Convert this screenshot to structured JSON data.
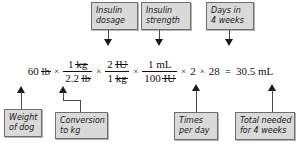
{
  "diagram": {
    "colors": {
      "box_fill": "#d9d9d9",
      "box_border": "#6e6e6e",
      "connector": "#4a4a4a",
      "text": "#111111",
      "background": "#ffffff"
    }
  },
  "equation": {
    "start_value": "60",
    "start_unit": "lb",
    "times_1": "×",
    "frac1": {
      "numerator_value": "1",
      "numerator_unit": "kg",
      "denominator_value": "2.2",
      "denominator_unit": "lb"
    },
    "times_2": "×",
    "frac2": {
      "numerator_value": "2",
      "numerator_unit": "IU",
      "denominator_value": "1",
      "denominator_unit": "kg"
    },
    "times_3": "×",
    "frac3": {
      "numerator_value": "1",
      "numerator_unit": "mL",
      "denominator_value": "100",
      "denominator_unit": "IU"
    },
    "times_4": "×",
    "factor_times_per_day": "2",
    "times_5": "×",
    "factor_days": "28",
    "equals": "=",
    "result_value": "30.5",
    "result_unit": "mL",
    "full_text": "60 lb × 1 kg / 2.2 lb × 2 IU / 1 kg × 1 mL / 100 IU × 2 × 28 = 30.5 mL"
  },
  "callouts_top": [
    {
      "id": "insulin-dosage",
      "line1": "Insulin",
      "line2": "dosage",
      "arrow": "arrow-down-icon"
    },
    {
      "id": "insulin-strength",
      "line1": "Insulin",
      "line2": "strength",
      "arrow": "arrow-down-icon"
    },
    {
      "id": "days-in-4-weeks",
      "line1": "Days in",
      "line2": "4 weeks",
      "arrow": "arrow-down-icon"
    }
  ],
  "callouts_bottom": [
    {
      "id": "weight-of-dog",
      "line1": "Weight",
      "line2": "of dog",
      "arrow": "arrow-up-icon"
    },
    {
      "id": "conversion-to-kg",
      "line1": "Conversion",
      "line2": "to kg",
      "arrow": "arrow-up-icon"
    },
    {
      "id": "times-per-day",
      "line1": "Times",
      "line2": "per day",
      "arrow": "arrow-up-icon"
    },
    {
      "id": "total-needed-for-4-weeks",
      "line1": "Total needed",
      "line2": "for 4 weeks",
      "arrow": "arrow-up-icon"
    }
  ]
}
